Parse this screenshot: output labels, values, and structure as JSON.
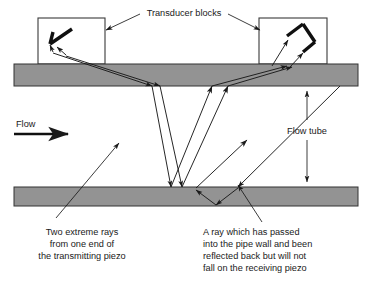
{
  "figure": {
    "title_label": "Transducer blocks",
    "flow_label": "Flow",
    "flow_tube_label": "Flow tube",
    "caption_left": {
      "line1": "Two extreme rays",
      "line2": "from one end of",
      "line3": "the transmitting piezo"
    },
    "caption_right": {
      "line1": "A ray which has passed",
      "line2": "into the pipe wall and been",
      "line3": "reflected back but will not",
      "line4": "fall on the receiving piezo"
    },
    "colors": {
      "wall_fill": "#939393",
      "wall_stroke": "#333333",
      "line": "#1a1a1a",
      "text": "#1a1a1a",
      "background": "#ffffff"
    },
    "geometry": {
      "upper_wall": {
        "x": 14,
        "y": 64,
        "width": 344,
        "height": 22
      },
      "lower_wall": {
        "x": 14,
        "y": 187,
        "width": 344,
        "height": 19
      },
      "left_block": {
        "x": 38,
        "y": 18,
        "width": 67,
        "height": 46
      },
      "right_block": {
        "x": 259,
        "y": 18,
        "width": 68,
        "height": 46
      }
    }
  }
}
